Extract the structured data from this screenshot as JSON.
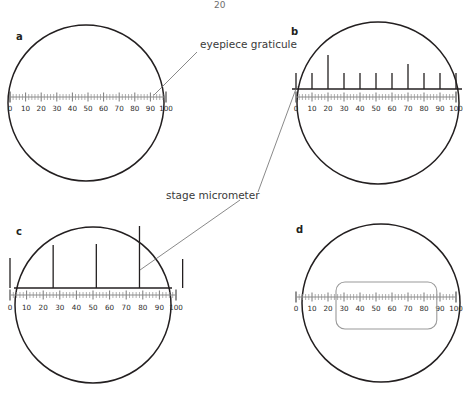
{
  "page": {
    "number": "20",
    "figure_caption_letters": [
      "a",
      "b",
      "c",
      "d"
    ]
  },
  "annotations": [
    {
      "id": "eyepiece-graticule",
      "text": "eyepiece graticule",
      "x": 200,
      "y": 48,
      "anchor": "start",
      "leaders": [
        {
          "x1": 197,
          "y1": 52,
          "x2": 154,
          "y2": 95
        }
      ]
    },
    {
      "id": "stage-micrometer",
      "text": "stage micrometer",
      "x": 166,
      "y": 199,
      "anchor": "start",
      "leaders": [
        {
          "x1": 258,
          "y1": 192,
          "x2": 297,
          "y2": 86
        },
        {
          "x1": 240,
          "y1": 200,
          "x2": 140,
          "y2": 270
        }
      ]
    }
  ],
  "graticule": {
    "tick_labels": [
      "0",
      "10",
      "20",
      "30",
      "40",
      "50",
      "60",
      "70",
      "80",
      "90",
      "100"
    ],
    "min": 0,
    "max": 100,
    "major_step": 10,
    "minor_per_major": 5,
    "units_note": "eyepiece graticule units"
  },
  "colors": {
    "outline": "#231f20",
    "graticule": "#8a8a8a",
    "graticule_label": "#2b2b2b",
    "micrometer": "#231f20",
    "leader": "#6b6b6b",
    "annotation_text": "#3a3a3a",
    "specimen_stroke": "#9a9a9a",
    "background": "#ffffff"
  },
  "panels": [
    {
      "id": "a",
      "letter": "a",
      "letter_x": 16,
      "letter_y": 40,
      "circle": {
        "cx": 86,
        "cy": 103,
        "r": 78
      },
      "graticule": {
        "x_start": 10,
        "x_end": 166,
        "y": 97,
        "label_y": 111
      },
      "micrometer": null,
      "specimen": null,
      "description": "eyepiece graticule alone in field of view"
    },
    {
      "id": "b",
      "letter": "b",
      "letter_x": 291,
      "letter_y": 35,
      "circle": {
        "cx": 378,
        "cy": 103,
        "r": 81
      },
      "graticule": {
        "x_start": 296,
        "x_end": 456,
        "y": 97,
        "label_y": 111
      },
      "micrometer": {
        "baseline_y": 89,
        "baseline_x_start": 292,
        "baseline_x_end": 462,
        "ticks": [
          {
            "value": 0,
            "height": 16
          },
          {
            "value": 10,
            "height": 16
          },
          {
            "value": 20,
            "height": 34
          },
          {
            "value": 30,
            "height": 16
          },
          {
            "value": 40,
            "height": 16
          },
          {
            "value": 50,
            "height": 16
          },
          {
            "value": 60,
            "height": 16
          },
          {
            "value": 70,
            "height": 25
          },
          {
            "value": 80,
            "height": 16
          },
          {
            "value": 90,
            "height": 16
          },
          {
            "value": 100,
            "height": 16
          }
        ]
      },
      "specimen": null,
      "description": "stage micrometer divisions coincide with graticule 10-unit marks"
    },
    {
      "id": "c",
      "letter": "c",
      "letter_x": 16,
      "letter_y": 235,
      "circle": {
        "cx": 93,
        "cy": 305,
        "r": 78
      },
      "graticule": {
        "x_start": 10,
        "x_end": 176,
        "y": 295,
        "label_y": 310
      },
      "micrometer": {
        "baseline_y": 288,
        "baseline_x_start": 14,
        "baseline_x_end": 172,
        "ticks": [
          {
            "value": 0,
            "height": 30
          },
          {
            "value": 26,
            "height": 43
          },
          {
            "value": 52,
            "height": 44
          },
          {
            "value": 78,
            "height": 62
          },
          {
            "value": 104,
            "height": 29
          }
        ]
      },
      "specimen": null,
      "description": "stage micrometer at higher magnification: divisions span about 26 graticule units"
    },
    {
      "id": "d",
      "letter": "d",
      "letter_x": 296,
      "letter_y": 233,
      "circle": {
        "cx": 381,
        "cy": 303,
        "r": 79
      },
      "graticule": {
        "x_start": 296,
        "x_end": 456,
        "y": 297,
        "label_y": 311
      },
      "micrometer": null,
      "specimen": {
        "value_start": 25,
        "value_end": 88,
        "y": 282,
        "height": 47,
        "corner_radius": 9,
        "label": "specimen"
      },
      "description": "specimen measured against eyepiece graticule, spanning about 25 to 88 units"
    }
  ]
}
